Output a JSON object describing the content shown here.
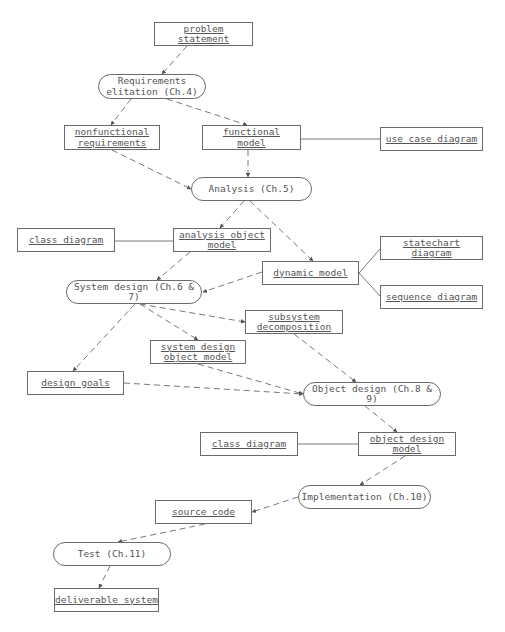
{
  "diagram": {
    "type": "activity-artifact flow",
    "nodes": {
      "problem_statement": {
        "label": "problem\nstatement",
        "kind": "artifact",
        "x": 154,
        "y": 22,
        "w": 99,
        "h": 24
      },
      "requirements_elicitation": {
        "label": "Requirements\nelitation (Ch.4)",
        "kind": "activity",
        "x": 98,
        "y": 74,
        "w": 108,
        "h": 25
      },
      "nonfunctional_requirements": {
        "label": "nonfunctional\nrequirements",
        "kind": "artifact",
        "x": 64,
        "y": 125,
        "w": 96,
        "h": 25
      },
      "functional_model": {
        "label": "functional\nmodel",
        "kind": "artifact",
        "x": 202,
        "y": 125,
        "w": 99,
        "h": 25
      },
      "use_case_diagram": {
        "label": "use case diagram",
        "kind": "artifact",
        "x": 380,
        "y": 127,
        "w": 103,
        "h": 24
      },
      "analysis": {
        "label": "Analysis (Ch.5)",
        "kind": "activity",
        "x": 191,
        "y": 177,
        "w": 121,
        "h": 24
      },
      "class_diagram_1": {
        "label": "class diagram",
        "kind": "artifact",
        "x": 17,
        "y": 228,
        "w": 98,
        "h": 24
      },
      "analysis_object_model": {
        "label": "analysis object\nmodel",
        "kind": "artifact",
        "x": 173,
        "y": 228,
        "w": 98,
        "h": 24
      },
      "statechart_diagram": {
        "label": "statechart diagram",
        "kind": "artifact",
        "x": 380,
        "y": 236,
        "w": 103,
        "h": 24
      },
      "dynamic_model": {
        "label": "dynamic model",
        "kind": "artifact",
        "x": 262,
        "y": 261,
        "w": 97,
        "h": 24
      },
      "system_design": {
        "label": "System design (Ch.6 & 7)",
        "kind": "activity",
        "x": 66,
        "y": 280,
        "w": 136,
        "h": 24
      },
      "sequence_diagram": {
        "label": "sequence diagram",
        "kind": "artifact",
        "x": 380,
        "y": 285,
        "w": 103,
        "h": 24
      },
      "subsystem_decomposition": {
        "label": "subsystem\ndecomposition",
        "kind": "artifact",
        "x": 245,
        "y": 310,
        "w": 98,
        "h": 24
      },
      "system_design_object_model": {
        "label": "system design\nobject model",
        "kind": "artifact",
        "x": 150,
        "y": 340,
        "w": 96,
        "h": 24
      },
      "design_goals": {
        "label": "design goals",
        "kind": "artifact",
        "x": 27,
        "y": 371,
        "w": 97,
        "h": 24
      },
      "object_design": {
        "label": "Object design (Ch.8 & 9)",
        "kind": "activity",
        "x": 303,
        "y": 382,
        "w": 138,
        "h": 24
      },
      "class_diagram_2": {
        "label": "class diagram",
        "kind": "artifact",
        "x": 200,
        "y": 432,
        "w": 98,
        "h": 24
      },
      "object_design_model": {
        "label": "object design\nmodel",
        "kind": "artifact",
        "x": 358,
        "y": 432,
        "w": 98,
        "h": 24
      },
      "implementation": {
        "label": "Implementation (Ch.10)",
        "kind": "activity",
        "x": 298,
        "y": 485,
        "w": 133,
        "h": 24
      },
      "source_code": {
        "label": "source code",
        "kind": "artifact",
        "x": 155,
        "y": 500,
        "w": 97,
        "h": 24
      },
      "test": {
        "label": "Test (Ch.11)",
        "kind": "activity",
        "x": 53,
        "y": 542,
        "w": 118,
        "h": 24
      },
      "deliverable_system": {
        "label": "deliverable system",
        "kind": "artifact",
        "x": 54,
        "y": 588,
        "w": 105,
        "h": 24
      }
    },
    "edges": [
      {
        "from": "problem_statement",
        "to": "requirements_elicitation",
        "style": "dashed-arrow",
        "points": [
          [
            187,
            46
          ],
          [
            162,
            74
          ]
        ]
      },
      {
        "from": "requirements_elicitation",
        "to": "nonfunctional_requirements",
        "style": "dashed-arrow",
        "points": [
          [
            131,
            99
          ],
          [
            111,
            125
          ]
        ]
      },
      {
        "from": "requirements_elicitation",
        "to": "functional_model",
        "style": "dashed-arrow",
        "points": [
          [
            167,
            99
          ],
          [
            247,
            125
          ]
        ]
      },
      {
        "from": "functional_model",
        "to": "use_case_diagram",
        "style": "solid",
        "points": [
          [
            301,
            139
          ],
          [
            380,
            139
          ]
        ]
      },
      {
        "from": "functional_model",
        "to": "analysis",
        "style": "dashed-arrow",
        "points": [
          [
            248,
            150
          ],
          [
            248,
            177
          ]
        ]
      },
      {
        "from": "nonfunctional_requirements",
        "to": "analysis",
        "style": "dashed-arrow",
        "points": [
          [
            112,
            150
          ],
          [
            191,
            189
          ]
        ]
      },
      {
        "from": "analysis",
        "to": "analysis_object_model",
        "style": "dashed-arrow",
        "points": [
          [
            244,
            201
          ],
          [
            220,
            228
          ]
        ]
      },
      {
        "from": "analysis",
        "to": "dynamic_model",
        "style": "dashed-arrow",
        "points": [
          [
            250,
            201
          ],
          [
            313,
            261
          ]
        ]
      },
      {
        "from": "class_diagram_1",
        "to": "analysis_object_model",
        "style": "solid",
        "points": [
          [
            115,
            241
          ],
          [
            173,
            241
          ]
        ]
      },
      {
        "from": "dynamic_model",
        "to": "statechart_diagram",
        "style": "solid",
        "points": [
          [
            359,
            273
          ],
          [
            380,
            249
          ]
        ]
      },
      {
        "from": "dynamic_model",
        "to": "sequence_diagram",
        "style": "solid",
        "points": [
          [
            359,
            273
          ],
          [
            380,
            296
          ]
        ]
      },
      {
        "from": "analysis_object_model",
        "to": "system_design",
        "style": "dashed-arrow",
        "points": [
          [
            190,
            252
          ],
          [
            157,
            280
          ]
        ]
      },
      {
        "from": "dynamic_model",
        "to": "system_design",
        "style": "dashed-arrow",
        "points": [
          [
            262,
            272
          ],
          [
            203,
            292
          ]
        ]
      },
      {
        "from": "system_design",
        "to": "subsystem_decomposition",
        "style": "dashed-arrow",
        "points": [
          [
            140,
            304
          ],
          [
            245,
            322
          ]
        ]
      },
      {
        "from": "system_design",
        "to": "system_design_object_model",
        "style": "dashed-arrow",
        "points": [
          [
            140,
            304
          ],
          [
            198,
            340
          ]
        ]
      },
      {
        "from": "system_design",
        "to": "design_goals",
        "style": "dashed-arrow",
        "points": [
          [
            135,
            304
          ],
          [
            73,
            371
          ]
        ]
      },
      {
        "from": "subsystem_decomposition",
        "to": "object_design",
        "style": "dashed-arrow",
        "points": [
          [
            294,
            334
          ],
          [
            356,
            382
          ]
        ]
      },
      {
        "from": "system_design_object_model",
        "to": "object_design",
        "style": "dashed-arrow",
        "points": [
          [
            198,
            364
          ],
          [
            303,
            394
          ]
        ]
      },
      {
        "from": "design_goals",
        "to": "object_design",
        "style": "dashed-arrow",
        "points": [
          [
            124,
            383
          ],
          [
            303,
            394
          ]
        ]
      },
      {
        "from": "object_design",
        "to": "object_design_model",
        "style": "dashed-arrow",
        "points": [
          [
            365,
            406
          ],
          [
            397,
            432
          ]
        ]
      },
      {
        "from": "class_diagram_2",
        "to": "object_design_model",
        "style": "solid",
        "points": [
          [
            298,
            444
          ],
          [
            358,
            444
          ]
        ]
      },
      {
        "from": "object_design_model",
        "to": "implementation",
        "style": "dashed-arrow",
        "points": [
          [
            405,
            456
          ],
          [
            360,
            485
          ]
        ]
      },
      {
        "from": "implementation",
        "to": "source_code",
        "style": "dashed-arrow",
        "points": [
          [
            298,
            497
          ],
          [
            252,
            512
          ]
        ]
      },
      {
        "from": "source_code",
        "to": "test",
        "style": "dashed-arrow",
        "points": [
          [
            205,
            524
          ],
          [
            118,
            542
          ]
        ]
      },
      {
        "from": "test",
        "to": "deliverable_system",
        "style": "dashed-arrow",
        "points": [
          [
            110,
            566
          ],
          [
            99,
            588
          ]
        ]
      }
    ],
    "colors": {
      "stroke": "#6a6a6a",
      "text": "#555555",
      "background": "#ffffff"
    }
  }
}
